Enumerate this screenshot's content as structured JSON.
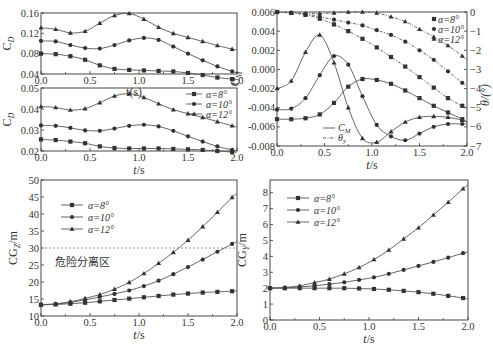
{
  "figure": {
    "markers": {
      "a8": "square",
      "a10": "circle",
      "a12": "triangle"
    },
    "colors": {
      "line": "#555555",
      "marker": "#333333",
      "frame": "#333333"
    }
  },
  "chart_data": [
    {
      "id": "cd_top",
      "type": "line",
      "title": "",
      "xlabel": "t(s)",
      "ylabel": "C_D",
      "xlim": [
        0,
        2.0
      ],
      "ylim": [
        0.04,
        0.16
      ],
      "xticks": [
        "0.0",
        "0.5",
        "1.0",
        "1.5",
        "2.0"
      ],
      "yticks": [
        "0.04",
        "0.08",
        "0.12",
        "0.16"
      ],
      "x": [
        0,
        0.15,
        0.3,
        0.45,
        0.6,
        0.75,
        0.9,
        1.05,
        1.2,
        1.35,
        1.5,
        1.65,
        1.8,
        1.95,
        2.0
      ],
      "series": [
        {
          "name": "α=8°",
          "marker": "square",
          "values": [
            0.08,
            0.079,
            0.075,
            0.068,
            0.057,
            0.05,
            0.048,
            0.047,
            0.046,
            0.045,
            0.042,
            0.038,
            0.033,
            0.03,
            0.029
          ]
        },
        {
          "name": "α=10°",
          "marker": "circle",
          "values": [
            0.105,
            0.104,
            0.097,
            0.091,
            0.09,
            0.097,
            0.106,
            0.111,
            0.107,
            0.094,
            0.08,
            0.067,
            0.055,
            0.045,
            0.042
          ]
        },
        {
          "name": "α=12°",
          "marker": "triangle",
          "values": [
            0.131,
            0.128,
            0.121,
            0.124,
            0.14,
            0.155,
            0.159,
            0.148,
            0.132,
            0.12,
            0.112,
            0.104,
            0.096,
            0.089,
            0.088
          ]
        }
      ]
    },
    {
      "id": "cd_bottom",
      "type": "line",
      "xlabel": "t/s",
      "ylabel": "C_D",
      "xlim": [
        0,
        2.0
      ],
      "ylim": [
        0.02,
        0.05
      ],
      "xticks": [
        "0.0",
        "0.5",
        "1.0",
        "1.5",
        "2.0"
      ],
      "yticks": [
        "0.02",
        "0.03",
        "0.04",
        "0.05"
      ],
      "legend": [
        "α=8°",
        "α=10°",
        "α=12°"
      ],
      "x": [
        0,
        0.15,
        0.3,
        0.45,
        0.6,
        0.75,
        0.9,
        1.05,
        1.2,
        1.35,
        1.5,
        1.65,
        1.8,
        1.95,
        2.0
      ],
      "series": [
        {
          "name": "α=8°",
          "marker": "square",
          "values": [
            0.0255,
            0.0252,
            0.0245,
            0.0237,
            0.0222,
            0.0214,
            0.0212,
            0.0212,
            0.0212,
            0.021,
            0.0208,
            0.0205,
            0.02,
            0.0195,
            0.0194
          ]
        },
        {
          "name": "α=10°",
          "marker": "circle",
          "values": [
            0.0322,
            0.032,
            0.031,
            0.0298,
            0.0296,
            0.0307,
            0.032,
            0.0325,
            0.0317,
            0.0296,
            0.027,
            0.0245,
            0.0222,
            0.0205,
            0.0202
          ]
        },
        {
          "name": "α=12°",
          "marker": "triangle",
          "values": [
            0.0412,
            0.0407,
            0.0395,
            0.0402,
            0.043,
            0.0462,
            0.0473,
            0.0455,
            0.0425,
            0.0397,
            0.0378,
            0.036,
            0.034,
            0.032,
            0.0315
          ]
        }
      ]
    },
    {
      "id": "cm_theta",
      "type": "line",
      "xlabel": "t/s",
      "ylabel": "C_M",
      "ylabel_right": "θ/(°)",
      "xlim": [
        0,
        2.0
      ],
      "ylim": [
        -0.008,
        0.006
      ],
      "ylim_right": [
        -7,
        0
      ],
      "xticks": [
        "0.0",
        "0.5",
        "1.0",
        "1.5",
        "2.0"
      ],
      "yticks": [
        "0.006",
        "0.004",
        "0.002",
        "0.000",
        "-0.002",
        "-0.004",
        "-0.006",
        "-0.008"
      ],
      "yticks_right": [
        "0",
        "-1",
        "-2",
        "-3",
        "-4",
        "-5",
        "-6",
        "-7"
      ],
      "legend": [
        "α=8°",
        "α=10°",
        "α=12°",
        "C_M",
        "θ_y"
      ],
      "x": [
        0,
        0.15,
        0.3,
        0.45,
        0.6,
        0.75,
        0.9,
        1.05,
        1.2,
        1.35,
        1.5,
        1.65,
        1.8,
        1.95,
        2.0
      ],
      "series": [
        {
          "name": "C_M α=8°",
          "axis": "left",
          "marker": "square",
          "values": [
            -0.0052,
            -0.0052,
            -0.0051,
            -0.0047,
            -0.0035,
            -0.0018,
            -0.001,
            -0.0011,
            -0.0015,
            -0.0022,
            -0.003,
            -0.0038,
            -0.0045,
            -0.0052,
            -0.0055
          ]
        },
        {
          "name": "C_M α=10°",
          "axis": "left",
          "marker": "circle",
          "values": [
            -0.0042,
            -0.0041,
            -0.003,
            -0.0006,
            0.0014,
            0.0005,
            -0.0028,
            -0.0058,
            -0.007,
            -0.0074,
            -0.0067,
            -0.006,
            -0.0057,
            -0.0057,
            -0.0057
          ]
        },
        {
          "name": "C_M α=12°",
          "axis": "left",
          "marker": "triangle",
          "values": [
            -0.002,
            -0.0012,
            0.0018,
            0.0036,
            0.0007,
            -0.004,
            -0.0072,
            -0.0076,
            -0.0065,
            -0.0055,
            -0.005,
            -0.0049,
            -0.005,
            -0.0053,
            -0.0055
          ]
        },
        {
          "name": "θ_y α=8°",
          "axis": "right",
          "marker": "square",
          "values": [
            0,
            -0.05,
            -0.15,
            -0.35,
            -0.65,
            -1.0,
            -1.4,
            -1.85,
            -2.35,
            -2.85,
            -3.4,
            -3.95,
            -4.5,
            -4.9,
            -5.0
          ]
        },
        {
          "name": "θ_y α=10°",
          "axis": "right",
          "marker": "circle",
          "values": [
            0,
            -0.05,
            -0.1,
            -0.25,
            -0.4,
            -0.55,
            -0.7,
            -0.95,
            -1.2,
            -1.55,
            -2.0,
            -2.5,
            -3.1,
            -3.7,
            -3.9
          ]
        },
        {
          "name": "θ_y α=12°",
          "axis": "right",
          "marker": "triangle",
          "values": [
            0,
            -0.05,
            -0.08,
            -0.08,
            -0.05,
            0,
            0,
            -0.05,
            -0.25,
            -0.5,
            -0.9,
            -1.3,
            -1.75,
            -2.3,
            -2.5
          ]
        }
      ]
    },
    {
      "id": "cgz",
      "type": "line",
      "xlabel": "t/s",
      "ylabel": "CG_Z/m",
      "xlim": [
        0,
        2.0
      ],
      "ylim": [
        10,
        50
      ],
      "xticks": [
        "0.0",
        "0.5",
        "1.0",
        "1.5",
        "2.0"
      ],
      "yticks": [
        "10",
        "15",
        "20",
        "25",
        "30",
        "35",
        "40",
        "45",
        "50"
      ],
      "legend": [
        "α=8°",
        "α=10°",
        "α=12°"
      ],
      "annotation": {
        "text": "危险分离区",
        "threshold": 30
      },
      "x": [
        0,
        0.15,
        0.3,
        0.45,
        0.6,
        0.75,
        0.9,
        1.05,
        1.2,
        1.35,
        1.5,
        1.65,
        1.8,
        1.95,
        2.0
      ],
      "series": [
        {
          "name": "α=8°",
          "marker": "square",
          "values": [
            13.3,
            13.4,
            13.6,
            13.9,
            14.3,
            14.7,
            15.1,
            15.5,
            15.9,
            16.3,
            16.6,
            16.9,
            17.1,
            17.3,
            17.3
          ]
        },
        {
          "name": "α=10°",
          "marker": "circle",
          "values": [
            13.3,
            13.5,
            14.0,
            14.7,
            15.6,
            16.5,
            17.5,
            18.8,
            20.4,
            22.3,
            24.4,
            26.6,
            28.9,
            31.2,
            32.0
          ]
        },
        {
          "name": "α=12°",
          "marker": "triangle",
          "values": [
            13.3,
            13.6,
            14.2,
            15.2,
            16.3,
            17.9,
            19.9,
            22.5,
            25.5,
            28.7,
            32.3,
            36.3,
            40.5,
            44.9,
            46.0
          ]
        }
      ]
    },
    {
      "id": "cgy",
      "type": "line",
      "xlabel": "t/s",
      "ylabel": "CG_Y/m",
      "xlim": [
        0,
        2.0
      ],
      "ylim": [
        0,
        8.8
      ],
      "xticks": [
        "0.0",
        "0.5",
        "1.0",
        "1.5",
        "2.0"
      ],
      "yticks": [
        "0",
        "1",
        "2",
        "3",
        "4",
        "5",
        "6",
        "7",
        "8"
      ],
      "legend": [
        "α=8°",
        "α=10°",
        "α=12°"
      ],
      "x": [
        0,
        0.15,
        0.3,
        0.45,
        0.6,
        0.75,
        0.9,
        1.05,
        1.2,
        1.35,
        1.5,
        1.65,
        1.8,
        1.95,
        2.0
      ],
      "series": [
        {
          "name": "α=8°",
          "marker": "square",
          "values": [
            2.0,
            2.0,
            2.0,
            2.0,
            2.0,
            2.0,
            1.98,
            1.95,
            1.9,
            1.83,
            1.75,
            1.65,
            1.52,
            1.38,
            1.33
          ]
        },
        {
          "name": "α=10°",
          "marker": "circle",
          "values": [
            2.0,
            2.02,
            2.07,
            2.15,
            2.25,
            2.37,
            2.52,
            2.68,
            2.9,
            3.15,
            3.4,
            3.65,
            3.92,
            4.2,
            4.28
          ]
        },
        {
          "name": "α=12°",
          "marker": "triangle",
          "values": [
            2.0,
            2.05,
            2.15,
            2.35,
            2.57,
            2.9,
            3.3,
            3.8,
            4.4,
            5.1,
            5.8,
            6.6,
            7.4,
            8.25,
            8.5
          ]
        }
      ]
    }
  ]
}
